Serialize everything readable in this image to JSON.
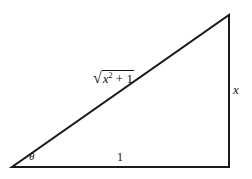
{
  "diagram": {
    "type": "right-triangle",
    "vertices": {
      "angle_vertex": [
        12,
        167
      ],
      "right_angle_vertex": [
        229,
        167
      ],
      "top_vertex": [
        229,
        15
      ]
    },
    "stroke_color": "#1a1a1a",
    "labels": {
      "hypotenuse": {
        "base": "x",
        "exponent": "2",
        "rest": " + 1",
        "radical": "√"
      },
      "opposite": "x",
      "adjacent": "1",
      "angle": "θ"
    }
  }
}
